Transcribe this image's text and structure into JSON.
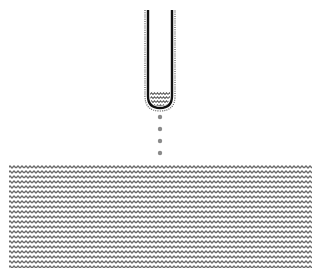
{
  "diagram": {
    "colors": {
      "background": "#ffffff",
      "tube_wall": "#111111",
      "tube_outline_dots": "#555555",
      "liquid_wave": "#6a6a6a",
      "drops": "#8a8a8a"
    },
    "tube": {
      "x_left": 148,
      "x_right": 172,
      "y_top": 10,
      "y_bottom": 108
    },
    "tube_liquid": {
      "y_top": 91,
      "y_bottom": 104
    },
    "drops": [
      {
        "cx": 160,
        "cy": 117
      },
      {
        "cx": 160,
        "cy": 129
      },
      {
        "cx": 160,
        "cy": 141
      },
      {
        "cx": 160,
        "cy": 153
      }
    ],
    "pool": {
      "x": 9,
      "y": 165,
      "width": 303,
      "height": 103
    }
  }
}
